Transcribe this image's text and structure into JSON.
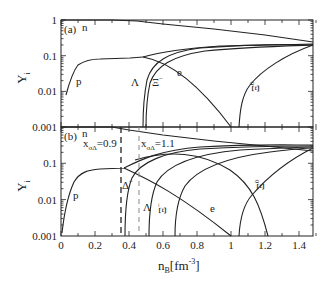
{
  "chart_data": [
    {
      "panel": "(a)",
      "type": "line",
      "xlabel": "n_B[fm^-3]",
      "ylabel": "Y_i",
      "yscale": "log",
      "xlim": [
        0,
        1.5
      ],
      "ylim": [
        0.001,
        1
      ],
      "yticks": [
        "1",
        "0.1",
        "0.01",
        "0.001"
      ],
      "grid": false,
      "series": [
        {
          "name": "n",
          "x": [
            0,
            0.3,
            0.45,
            0.6,
            0.9,
            1.2,
            1.5
          ],
          "y": [
            0.99,
            0.99,
            0.97,
            0.8,
            0.55,
            0.38,
            0.24
          ]
        },
        {
          "name": "p",
          "x": [
            0.03,
            0.06,
            0.1,
            0.15,
            0.2,
            0.3,
            0.42,
            0.48
          ],
          "y": [
            0.008,
            0.02,
            0.04,
            0.052,
            0.055,
            0.056,
            0.058,
            0.065
          ]
        },
        {
          "name": "Λ",
          "x": [
            0.48,
            0.49,
            0.5,
            0.55,
            0.7,
            0.9,
            1.2,
            1.5
          ],
          "y": [
            0.001,
            0.005,
            0.02,
            0.07,
            0.12,
            0.15,
            0.18,
            0.2
          ]
        },
        {
          "name": "Ξ⁻",
          "x": [
            0.5,
            0.51,
            0.53,
            0.6,
            0.75,
            1.0,
            1.3,
            1.5
          ],
          "y": [
            0.001,
            0.006,
            0.025,
            0.08,
            0.13,
            0.16,
            0.18,
            0.19
          ]
        },
        {
          "name": "e",
          "x": [
            0.48,
            0.6,
            0.8,
            1.0,
            1.05
          ],
          "y": [
            0.065,
            0.035,
            0.01,
            0.0025,
            0.001
          ]
        },
        {
          "name": "Ξ⁰",
          "x": [
            1.05,
            1.07,
            1.12,
            1.2,
            1.35,
            1.5
          ],
          "y": [
            0.001,
            0.006,
            0.03,
            0.07,
            0.13,
            0.2
          ]
        },
        {
          "name": "p (upper)",
          "x": [
            0.48,
            0.7,
            1.0,
            1.3,
            1.5
          ],
          "y": [
            0.065,
            0.12,
            0.16,
            0.19,
            0.2
          ]
        }
      ]
    },
    {
      "panel": "(b)",
      "type": "line",
      "xlabel": "n_B[fm^-3]",
      "ylabel": "Y_i",
      "yscale": "log",
      "xlim": [
        0,
        1.5
      ],
      "ylim": [
        0.001,
        1
      ],
      "xticks": [
        "0",
        "0.2",
        "0.4",
        "0.6",
        "0.8",
        "1",
        "1.2",
        "1.4"
      ],
      "yticks": [
        "0.1",
        "0.01",
        "0.001"
      ],
      "grid": false,
      "annotations": [
        {
          "text": "x_σΔ=0.9",
          "x": 0.35,
          "style": "dashed black vertical line"
        },
        {
          "text": "x_σΔ=1.1",
          "x": 0.46,
          "style": "dashed gray vertical line"
        }
      ],
      "series": [
        {
          "name": "n",
          "x": [
            0,
            0.3,
            0.4,
            0.6,
            0.9,
            1.2,
            1.5
          ],
          "y": [
            0.99,
            0.99,
            0.85,
            0.6,
            0.42,
            0.3,
            0.22
          ]
        },
        {
          "name": "p",
          "x": [
            0.01,
            0.03,
            0.06,
            0.1,
            0.15,
            0.2,
            0.3,
            0.37
          ],
          "y": [
            0.0012,
            0.005,
            0.02,
            0.045,
            0.055,
            0.057,
            0.058,
            0.06
          ]
        },
        {
          "name": "Δ⁻",
          "x": [
            0.38,
            0.385,
            0.4,
            0.45,
            0.6,
            0.9,
            1.2,
            1.5
          ],
          "y": [
            0.001,
            0.005,
            0.03,
            0.08,
            0.14,
            0.18,
            0.2,
            0.2
          ]
        },
        {
          "name": "Λ",
          "x": [
            0.52,
            0.53,
            0.56,
            0.65,
            0.85,
            1.1,
            1.5
          ],
          "y": [
            0.001,
            0.006,
            0.03,
            0.08,
            0.14,
            0.17,
            0.2
          ]
        },
        {
          "name": "Ξ⁻",
          "x": [
            0.67,
            0.68,
            0.72,
            0.85,
            1.1,
            1.5
          ],
          "y": [
            0.001,
            0.006,
            0.03,
            0.08,
            0.14,
            0.2
          ]
        },
        {
          "name": "e",
          "x": [
            0.37,
            0.5,
            0.7,
            0.9,
            1.05
          ],
          "y": [
            0.06,
            0.025,
            0.009,
            0.003,
            0.001
          ]
        },
        {
          "name": "Ξ⁰",
          "x": [
            1.05,
            1.07,
            1.12,
            1.25,
            1.5
          ],
          "y": [
            0.001,
            0.006,
            0.025,
            0.08,
            0.2
          ]
        },
        {
          "name": "p (upper)",
          "x": [
            0.37,
            0.5,
            0.8,
            1.0,
            1.1,
            1.2,
            1.22
          ],
          "y": [
            0.06,
            0.1,
            0.09,
            0.04,
            0.015,
            0.003,
            0.001
          ]
        }
      ]
    }
  ],
  "labels": {
    "panel_a": "(a)",
    "panel_b": "(b)",
    "y_axis": "Y",
    "y_axis_sub": "i",
    "x_axis_main": "n",
    "x_axis_sub": "B",
    "x_axis_unit": "[fm",
    "x_axis_exp": "-3",
    "x_axis_close": "]",
    "curve_n_a": "n",
    "curve_p_a": "p",
    "curve_lambda_a": "Λ",
    "curve_xim_a": "Ξ",
    "curve_xim_a_sup": "−",
    "curve_e_a": "e",
    "curve_xi0_a": "Ξ",
    "curve_xi0_a_sup": "0",
    "curve_n_b": "n",
    "curve_p_b": "p",
    "curve_delta_b": "Δ",
    "curve_delta_b_sup": "−",
    "curve_lambda_b": "Λ",
    "curve_xim_b": "Ξ",
    "curve_xim_b_sup": "−",
    "curve_e_b": "e",
    "curve_xi0_b": "Ξ",
    "curve_xi0_b_sup": "0",
    "ann1_x": "x",
    "ann1_sub": "σΔ",
    "ann1_val": "=0.9",
    "ann2_x": "x",
    "ann2_sub": "σΔ",
    "ann2_val": "=1.1"
  },
  "ticks": {
    "top_y": [
      "1",
      "0.1",
      "0.01",
      "0.001"
    ],
    "bottom_y": [
      "0.1",
      "0.01",
      "0.001"
    ],
    "x": [
      "0",
      "0.2",
      "0.4",
      "0.6",
      "0.8",
      "1",
      "1.2",
      "1.4"
    ]
  }
}
